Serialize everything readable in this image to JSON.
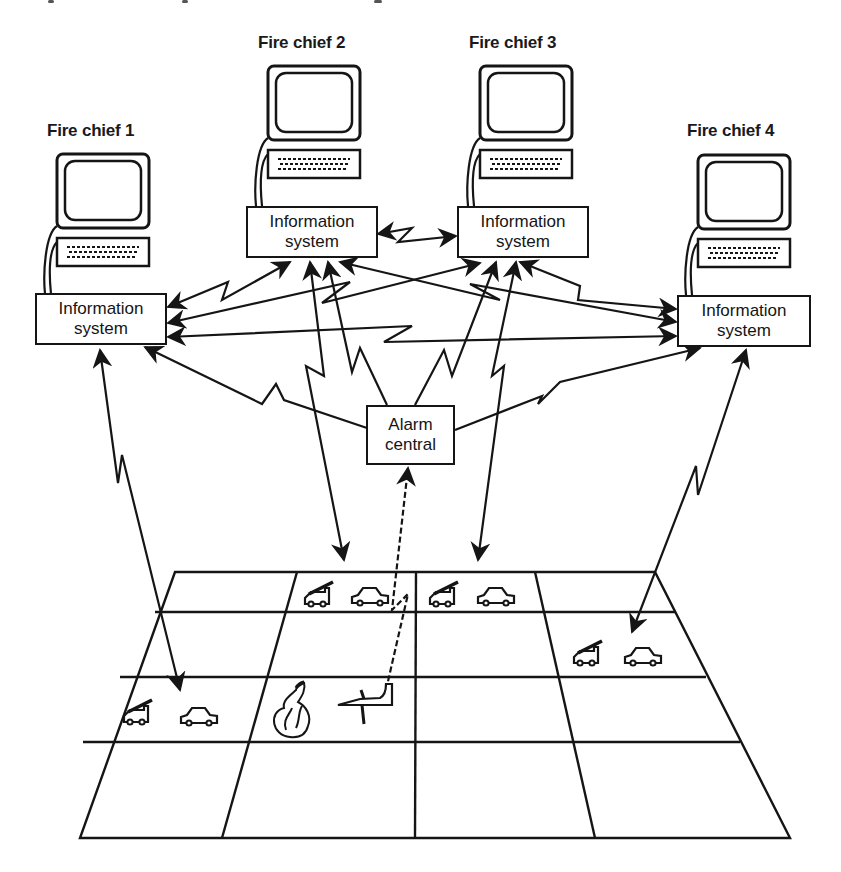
{
  "diagram": {
    "title_fragment": "",
    "fire_chiefs": [
      {
        "label": "Fire chief 1",
        "info_system": {
          "line1": "Information",
          "line2": "system"
        }
      },
      {
        "label": "Fire chief 2",
        "info_system": {
          "line1": "Information",
          "line2": "system"
        }
      },
      {
        "label": "Fire chief 3",
        "info_system": {
          "line1": "Information",
          "line2": "system"
        }
      },
      {
        "label": "Fire chief 4",
        "info_system": {
          "line1": "Information",
          "line2": "system"
        }
      }
    ],
    "alarm_central": {
      "line1": "Alarm",
      "line2": "central"
    },
    "map_grid": {
      "rows": 4,
      "cols": 4,
      "cells_with_content": [
        {
          "row": 1,
          "col": 2,
          "items": [
            "fire-engine",
            "car"
          ]
        },
        {
          "row": 1,
          "col": 3,
          "items": [
            "fire-engine",
            "car"
          ]
        },
        {
          "row": 2,
          "col": 4,
          "items": [
            "fire-engine",
            "car"
          ]
        },
        {
          "row": 3,
          "col": 1,
          "items": [
            "fire-engine",
            "car"
          ]
        },
        {
          "row": 3,
          "col": 2,
          "items": [
            "fire",
            "airplane"
          ]
        }
      ]
    },
    "connections": [
      {
        "from": "Information system 2",
        "to": "Information system 3",
        "type": "wireless-bidirectional"
      },
      {
        "from": "Information system 1",
        "to": "Information system 2",
        "type": "wireless-bidirectional"
      },
      {
        "from": "Information system 1",
        "to": "Information system 3",
        "type": "wireless-bidirectional"
      },
      {
        "from": "Information system 1",
        "to": "Information system 4",
        "type": "wireless-bidirectional"
      },
      {
        "from": "Information system 2",
        "to": "Information system 4",
        "type": "wireless-bidirectional"
      },
      {
        "from": "Information system 3",
        "to": "Information system 4",
        "type": "wireless-bidirectional"
      },
      {
        "from": "Alarm central",
        "to": "Information system 1",
        "type": "wireless"
      },
      {
        "from": "Alarm central",
        "to": "Information system 2",
        "type": "wireless"
      },
      {
        "from": "Alarm central",
        "to": "Information system 3",
        "type": "wireless"
      },
      {
        "from": "Alarm central",
        "to": "Information system 4",
        "type": "wireless"
      },
      {
        "from": "Information system 1",
        "to": "Grid unit (row 3, col 1)",
        "type": "wireless-bidirectional"
      },
      {
        "from": "Information system 2",
        "to": "Grid unit (row 1, col 2)",
        "type": "wireless-bidirectional"
      },
      {
        "from": "Information system 3",
        "to": "Grid unit (row 1, col 3)",
        "type": "wireless-bidirectional"
      },
      {
        "from": "Information system 4",
        "to": "Grid unit (row 2, col 4)",
        "type": "wireless-bidirectional"
      },
      {
        "from": "Airplane incident",
        "to": "Alarm central",
        "type": "wireless-dashed"
      }
    ],
    "colors": {
      "ink": "#151515",
      "background": "#ffffff"
    }
  }
}
